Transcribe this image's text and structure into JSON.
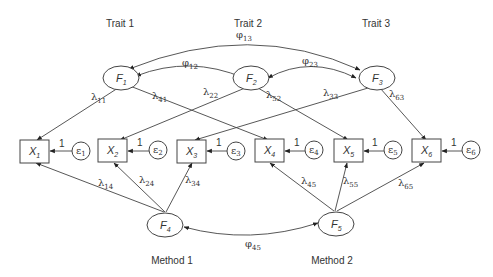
{
  "diagram": {
    "type": "path diagram (multitrait-multimethod CFA)",
    "groups": {
      "traits": [
        "Trait 1",
        "Trait 2",
        "Trait 3"
      ],
      "methods": [
        "Method 1",
        "Method 2"
      ]
    },
    "latent_factors": [
      {
        "id": "F1",
        "label": "F",
        "sub": "1",
        "group": "Trait 1"
      },
      {
        "id": "F2",
        "label": "F",
        "sub": "2",
        "group": "Trait 2"
      },
      {
        "id": "F3",
        "label": "F",
        "sub": "3",
        "group": "Trait 3"
      },
      {
        "id": "F4",
        "label": "F",
        "sub": "4",
        "group": "Method 1"
      },
      {
        "id": "F5",
        "label": "F",
        "sub": "5",
        "group": "Method 2"
      }
    ],
    "observed": [
      {
        "id": "X1",
        "label": "X",
        "sub": "1"
      },
      {
        "id": "X2",
        "label": "X",
        "sub": "2"
      },
      {
        "id": "X3",
        "label": "X",
        "sub": "3"
      },
      {
        "id": "X4",
        "label": "X",
        "sub": "4"
      },
      {
        "id": "X5",
        "label": "X",
        "sub": "5"
      },
      {
        "id": "X6",
        "label": "X",
        "sub": "6"
      }
    ],
    "errors": [
      {
        "id": "e1",
        "label": "ε",
        "sub": "1",
        "to": "X1",
        "weight": "1"
      },
      {
        "id": "e2",
        "label": "ε",
        "sub": "2",
        "to": "X2",
        "weight": "1"
      },
      {
        "id": "e3",
        "label": "ε",
        "sub": "3",
        "to": "X3",
        "weight": "1"
      },
      {
        "id": "e4",
        "label": "ε",
        "sub": "4",
        "to": "X4",
        "weight": "1"
      },
      {
        "id": "e5",
        "label": "ε",
        "sub": "5",
        "to": "X5",
        "weight": "1"
      },
      {
        "id": "e6",
        "label": "ε",
        "sub": "6",
        "to": "X6",
        "weight": "1"
      }
    ],
    "loadings": [
      {
        "from": "F1",
        "to": "X1",
        "label": "λ",
        "sub": "11"
      },
      {
        "from": "F1",
        "to": "X4",
        "label": "λ",
        "sub": "41"
      },
      {
        "from": "F2",
        "to": "X2",
        "label": "λ",
        "sub": "22"
      },
      {
        "from": "F2",
        "to": "X5",
        "label": "λ",
        "sub": "52"
      },
      {
        "from": "F3",
        "to": "X3",
        "label": "λ",
        "sub": "33"
      },
      {
        "from": "F3",
        "to": "X6",
        "label": "λ",
        "sub": "63"
      },
      {
        "from": "F4",
        "to": "X1",
        "label": "λ",
        "sub": "14"
      },
      {
        "from": "F4",
        "to": "X2",
        "label": "λ",
        "sub": "24"
      },
      {
        "from": "F4",
        "to": "X3",
        "label": "λ",
        "sub": "34"
      },
      {
        "from": "F5",
        "to": "X4",
        "label": "λ",
        "sub": "45"
      },
      {
        "from": "F5",
        "to": "X5",
        "label": "λ",
        "sub": "55"
      },
      {
        "from": "F5",
        "to": "X6",
        "label": "λ",
        "sub": "65"
      }
    ],
    "covariances": [
      {
        "a": "F1",
        "b": "F2",
        "label": "φ",
        "sub": "12"
      },
      {
        "a": "F2",
        "b": "F3",
        "label": "φ",
        "sub": "23"
      },
      {
        "a": "F1",
        "b": "F3",
        "label": "φ",
        "sub": "13"
      },
      {
        "a": "F4",
        "b": "F5",
        "label": "φ",
        "sub": "45"
      }
    ]
  },
  "text": {
    "trait1": "Trait 1",
    "trait2": "Trait 2",
    "trait3": "Trait 3",
    "method1": "Method 1",
    "method2": "Method 2",
    "F": "F",
    "X": "X",
    "eps": "ε",
    "lam": "λ",
    "phi": "φ",
    "one": "1",
    "s1": "1",
    "s2": "2",
    "s3": "3",
    "s4": "4",
    "s5": "5",
    "s6": "6",
    "l11": "11",
    "l41": "41",
    "l22": "22",
    "l52": "52",
    "l33": "33",
    "l63": "63",
    "l14": "14",
    "l24": "24",
    "l34": "34",
    "l45": "45",
    "l55": "55",
    "l65": "65",
    "p12": "12",
    "p23": "23",
    "p13": "13",
    "p45": "45"
  }
}
